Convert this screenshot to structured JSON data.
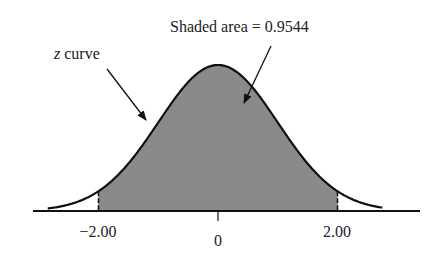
{
  "chart_data": {
    "type": "area",
    "title": "",
    "curve_label": "z curve",
    "annotation": "Shaded area = 0.9544",
    "shaded_area": 0.9544,
    "shaded_interval": [
      -2.0,
      2.0
    ],
    "x_ticks": [
      {
        "value": -2.0,
        "label": "−2.00"
      },
      {
        "value": 0,
        "label": "0"
      },
      {
        "value": 2.0,
        "label": "2.00"
      }
    ],
    "xlim": [
      -3.1,
      3.4
    ],
    "distribution": "standard normal",
    "grid": false,
    "legend": "none",
    "colors": {
      "shade": "#8a8a8a",
      "curve": "#111111",
      "axis": "#111111"
    }
  },
  "labels": {
    "curve": "z curve",
    "area": "Shaded area = 0.9544",
    "tick_neg2": "−2.00",
    "tick_0": "0",
    "tick_pos2": "2.00"
  }
}
